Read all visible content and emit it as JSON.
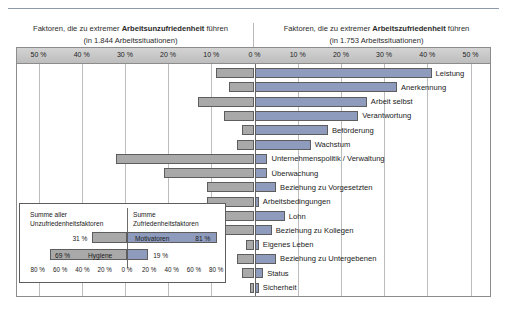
{
  "header": {
    "left_pre": "Faktoren, die zu extremer ",
    "left_strong": "Arbeitsunzufriedenheit",
    "left_post": " führen",
    "left_sub": "(in 1.844 Arbeitssituationen)",
    "right_pre": "Faktoren, die zu extremer ",
    "right_strong": "Arbeitszufriedenheit",
    "right_post": " führen",
    "right_sub": "(in 1.753 Arbeitssituationen)"
  },
  "colors": {
    "negative_bar": "#a9a9a9",
    "positive_bar": "#8e9bbd",
    "bar_border": "#5d5d5d",
    "axis_band": "#c6c6c6",
    "gridline": "#bdbdbd",
    "zero_line": "#6b6b6b",
    "frame": "#8c8c8c"
  },
  "chart_data": {
    "type": "bar",
    "orientation": "horizontal",
    "style": "diverging-tornado",
    "xlabel": "",
    "ylabel": "",
    "xlim": [
      -50,
      50
    ],
    "axis_ticks": [
      "50 %",
      "40 %",
      "30 %",
      "20 %",
      "10 %",
      "0 %",
      "10 %",
      "20 %",
      "30 %",
      "40 %",
      "50 %"
    ],
    "axis_tick_values": [
      -50,
      -40,
      -30,
      -20,
      -10,
      0,
      10,
      20,
      30,
      40,
      50
    ],
    "grid": true,
    "legend": [
      "Arbeitsunzufriedenheit (negativ)",
      "Arbeitszufriedenheit (positiv)"
    ],
    "categories": [
      "Leistung",
      "Anerkennung",
      "Arbeit selbst",
      "Verantwortung",
      "Beförderung",
      "Wachstum",
      "Unternehmenspolitik / Verwaltung",
      "Überwachung",
      "Beziehung zu Vorgesetzten",
      "Arbeitsbedingungen",
      "Lohn",
      "Beziehung zu Kollegen",
      "Eigenes Leben",
      "Beziehung zu Untergebenen",
      "Status",
      "Sicherheit"
    ],
    "series": [
      {
        "name": "Arbeitsunzufriedenheit",
        "direction": "left",
        "values": [
          -9,
          -6,
          -13,
          -7,
          -3,
          -4,
          -32,
          -21,
          -11,
          -11,
          -12,
          -7,
          -2,
          -4,
          -3,
          -1
        ]
      },
      {
        "name": "Arbeitszufriedenheit",
        "direction": "right",
        "values": [
          41,
          33,
          26,
          24,
          17,
          13,
          3,
          3,
          5,
          1,
          7,
          4,
          1,
          5,
          2,
          1
        ]
      }
    ]
  },
  "inset": {
    "title_left": "Summe aller\nUnzufriedenheitsfaktoren",
    "title_right": "Summe\nZufriedenheitsfaktoren",
    "axis_ticks": [
      "80 %",
      "60 %",
      "40 %",
      "20 %",
      "0 %",
      "20 %",
      "40 %",
      "60 %",
      "80 %"
    ],
    "axis_tick_values": [
      -80,
      -60,
      -40,
      -20,
      0,
      20,
      40,
      60,
      80
    ],
    "rows": [
      {
        "name": "Motivatoren",
        "negative_label": "31 %",
        "positive_label": "81 %",
        "negative_value": -31,
        "positive_value": 81,
        "label_inside": "positive"
      },
      {
        "name": "Hygiene",
        "negative_label": "69 %",
        "positive_label": "19 %",
        "negative_value": -69,
        "positive_value": 19,
        "label_inside": "negative"
      }
    ]
  }
}
